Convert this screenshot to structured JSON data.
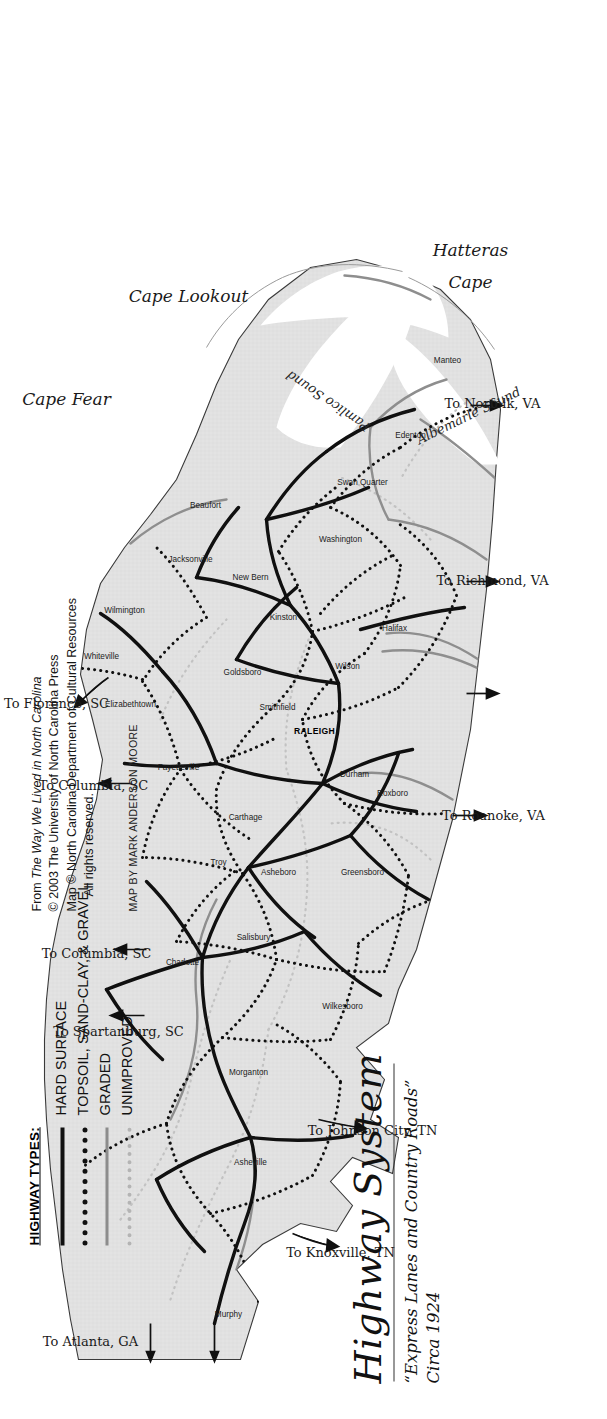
{
  "title": {
    "main": "Highway System",
    "subtitle_line1": "“Express Lanes and Country Roads”",
    "subtitle_line2": "Circa 1924"
  },
  "legend": {
    "heading": "HIGHWAY TYPES:",
    "items": [
      {
        "label": "HARD SURFACE",
        "style": "solid-black",
        "color": "#101010"
      },
      {
        "label": "TOPSOIL, SAND-CLAY, & GRAVEL",
        "style": "dotted-black",
        "color": "#101010"
      },
      {
        "label": "GRADED",
        "style": "solid-gray",
        "color": "#8c8c8c"
      },
      {
        "label": "UNIMPROVED",
        "style": "dotted-gray",
        "color": "#b4b4b4"
      }
    ]
  },
  "credit": {
    "line1_prefix": "From ",
    "line1_italic": "The Way We Lived in North Carolina",
    "line2": "© 2003 The University of North Carolina Press",
    "line3": "Map © North Carolina Department of Cultural Resources",
    "line4": "All rights reserved.",
    "byline": "MAP BY MARK ANDERSON MOORE"
  },
  "map": {
    "capital": {
      "name": "RALEIGH",
      "x": 686,
      "y": 314
    },
    "cities": [
      {
        "name": "Murphy",
        "x": 103,
        "y": 228
      },
      {
        "name": "Asheville",
        "x": 255,
        "y": 250
      },
      {
        "name": "Morganton",
        "x": 345,
        "y": 248
      },
      {
        "name": "Wilkesboro",
        "x": 411,
        "y": 342
      },
      {
        "name": "Charlotte",
        "x": 455,
        "y": 182
      },
      {
        "name": "Salisbury",
        "x": 480,
        "y": 253
      },
      {
        "name": "Greensboro",
        "x": 545,
        "y": 362
      },
      {
        "name": "Asheboro",
        "x": 545,
        "y": 278
      },
      {
        "name": "Troy",
        "x": 555,
        "y": 218
      },
      {
        "name": "Carthage",
        "x": 600,
        "y": 245
      },
      {
        "name": "Roxboro",
        "x": 624,
        "y": 392
      },
      {
        "name": "Durham",
        "x": 643,
        "y": 354
      },
      {
        "name": "Fayetteville",
        "x": 650,
        "y": 178
      },
      {
        "name": "Elizabethtown",
        "x": 713,
        "y": 130
      },
      {
        "name": "Whiteville",
        "x": 761,
        "y": 101
      },
      {
        "name": "Smithfield",
        "x": 710,
        "y": 277
      },
      {
        "name": "Goldsboro",
        "x": 745,
        "y": 242
      },
      {
        "name": "Wilson",
        "x": 751,
        "y": 347
      },
      {
        "name": "Halifax",
        "x": 789,
        "y": 394
      },
      {
        "name": "Kinston",
        "x": 800,
        "y": 283
      },
      {
        "name": "New Bern",
        "x": 840,
        "y": 250
      },
      {
        "name": "Jacksonville",
        "x": 858,
        "y": 190
      },
      {
        "name": "Wilmington",
        "x": 807,
        "y": 124
      },
      {
        "name": "Beaufort",
        "x": 912,
        "y": 205
      },
      {
        "name": "Washington",
        "x": 878,
        "y": 340
      },
      {
        "name": "Swan Quarter",
        "x": 935,
        "y": 362
      },
      {
        "name": "Edenton",
        "x": 982,
        "y": 410
      },
      {
        "name": "Manteo",
        "x": 1057,
        "y": 447
      }
    ],
    "water_labels": [
      {
        "name": "Albemarle Sound",
        "x": 1000,
        "y": 470
      },
      {
        "name": "Pamlico Sound",
        "x": 1022,
        "y": 330
      }
    ],
    "cape_labels": [
      {
        "name": "Cape Hatteras",
        "x": 1148,
        "y": 470
      },
      {
        "name": "Cape Lookout",
        "x": 1118,
        "y": 188
      },
      {
        "name": "Cape Fear",
        "x": 1015,
        "y": 66
      }
    ],
    "destination_arrows": [
      {
        "label": "To Atlanta, GA",
        "x": 74,
        "y": 90
      },
      {
        "label": "To Knoxville, TN",
        "x": 163,
        "y": 340
      },
      {
        "label": "To Johnson City, TN",
        "x": 285,
        "y": 372
      },
      {
        "label": "To Spartanburg, SC",
        "x": 384,
        "y": 118
      },
      {
        "label": "To Columbia, SC",
        "x": 462,
        "y": 96
      },
      {
        "label": "To Columbia, SC",
        "x": 630,
        "y": 93
      },
      {
        "label": "To Florence, SC",
        "x": 712,
        "y": 56
      },
      {
        "label": "To Roanoke, VA",
        "x": 600,
        "y": 493
      },
      {
        "label": "To Richmond, VA",
        "x": 835,
        "y": 492
      },
      {
        "label": "To Norfolk, VA",
        "x": 1012,
        "y": 492
      }
    ]
  }
}
